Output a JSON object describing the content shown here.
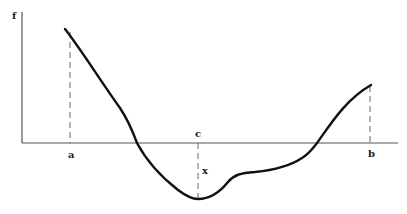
{
  "diagram": {
    "type": "function-curve",
    "axes": {
      "y_label": "f",
      "x_axis_y": 143,
      "y_axis_x": 22
    },
    "point_labels": {
      "a": "a",
      "b": "b",
      "c": "c",
      "x": "x"
    },
    "colors": {
      "curve": "#111111",
      "axis": "#555555",
      "dashed": "#666666",
      "background": "#ffffff"
    }
  }
}
